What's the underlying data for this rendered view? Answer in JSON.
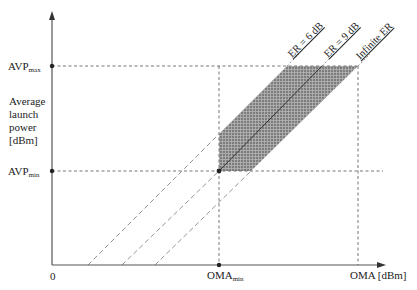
{
  "diagram": {
    "y_axis": {
      "label_lines": [
        "Average",
        "launch",
        "power",
        "[dBm]"
      ],
      "ticks": [
        {
          "base": "AVP",
          "sub": "max"
        },
        {
          "base": "AVP",
          "sub": "min"
        }
      ]
    },
    "x_axis": {
      "origin": "0",
      "tick": {
        "base": "OMA",
        "sub": "min"
      },
      "label": "OMA [dBm]"
    },
    "lines": [
      {
        "label": "ER = 6 dB"
      },
      {
        "label": "ER = 9 dB"
      },
      {
        "label": "Infinite ER"
      }
    ],
    "colors": {
      "shade": "#8a8a8a",
      "axis": "#555555",
      "dash": "#777777"
    }
  }
}
